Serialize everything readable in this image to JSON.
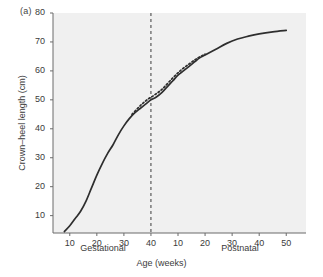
{
  "panel": {
    "label": "(a)"
  },
  "axes": {
    "y_title": "Crown–heel length (cm)",
    "x_title": "Age (weeks)",
    "segment_gestational": "Gestational",
    "segment_postnatal": "Postnatal"
  },
  "annotations": {
    "birth": "Birth"
  },
  "chart_data": {
    "type": "line",
    "title": "",
    "subtitle": "",
    "panel_label": "(a)",
    "xlabel": "Age (weeks)",
    "ylabel": "Crown–heel length (cm)",
    "ylim": [
      4,
      80
    ],
    "yticks": [
      10,
      20,
      30,
      40,
      50,
      60,
      70,
      80
    ],
    "ytick_labels": [
      "10",
      "20",
      "30",
      "40",
      "50",
      "60",
      "70",
      "80"
    ],
    "grid": false,
    "legend": "none",
    "background_color": "#f0f0f0",
    "line_color": "#2e2e2e",
    "x_axis": {
      "segments": [
        {
          "name": "Gestational",
          "ticks": [
            10,
            20,
            30,
            40
          ],
          "tick_labels": [
            "10",
            "20",
            "30",
            "40"
          ],
          "range": [
            6,
            40
          ]
        },
        {
          "name": "Postnatal",
          "ticks": [
            10,
            20,
            30,
            40,
            50
          ],
          "tick_labels": [
            "10",
            "20",
            "30",
            "40",
            "50"
          ],
          "range": [
            0,
            50
          ]
        }
      ]
    },
    "annotations": [
      {
        "text": "Birth",
        "type": "vertical-dashed-line",
        "x_segment": "Gestational",
        "x_value": 40,
        "label_position": "left-of-line"
      }
    ],
    "series": [
      {
        "name": "crown-heel length (solid)",
        "style": "solid",
        "color": "#2e2e2e",
        "points": [
          {
            "segment": "Gestational",
            "x": 8,
            "y": 4.5
          },
          {
            "segment": "Gestational",
            "x": 10,
            "y": 6.5
          },
          {
            "segment": "Gestational",
            "x": 12,
            "y": 9.0
          },
          {
            "segment": "Gestational",
            "x": 14,
            "y": 11.5
          },
          {
            "segment": "Gestational",
            "x": 16,
            "y": 15.0
          },
          {
            "segment": "Gestational",
            "x": 18,
            "y": 19.5
          },
          {
            "segment": "Gestational",
            "x": 20,
            "y": 24.0
          },
          {
            "segment": "Gestational",
            "x": 22,
            "y": 28.0
          },
          {
            "segment": "Gestational",
            "x": 24,
            "y": 31.5
          },
          {
            "segment": "Gestational",
            "x": 26,
            "y": 34.5
          },
          {
            "segment": "Gestational",
            "x": 28,
            "y": 38.0
          },
          {
            "segment": "Gestational",
            "x": 30,
            "y": 41.0
          },
          {
            "segment": "Gestational",
            "x": 32,
            "y": 43.5
          },
          {
            "segment": "Gestational",
            "x": 34,
            "y": 45.5
          },
          {
            "segment": "Gestational",
            "x": 36,
            "y": 47.0
          },
          {
            "segment": "Gestational",
            "x": 38,
            "y": 48.5
          },
          {
            "segment": "Gestational",
            "x": 40,
            "y": 50.0
          },
          {
            "segment": "Postnatal",
            "x": 2,
            "y": 51.0
          },
          {
            "segment": "Postnatal",
            "x": 4,
            "y": 52.5
          },
          {
            "segment": "Postnatal",
            "x": 6,
            "y": 54.5
          },
          {
            "segment": "Postnatal",
            "x": 8,
            "y": 56.5
          },
          {
            "segment": "Postnatal",
            "x": 10,
            "y": 58.5
          },
          {
            "segment": "Postnatal",
            "x": 12,
            "y": 60.0
          },
          {
            "segment": "Postnatal",
            "x": 14,
            "y": 61.5
          },
          {
            "segment": "Postnatal",
            "x": 16,
            "y": 63.0
          },
          {
            "segment": "Postnatal",
            "x": 18,
            "y": 64.5
          },
          {
            "segment": "Postnatal",
            "x": 20,
            "y": 65.5
          },
          {
            "segment": "Postnatal",
            "x": 24,
            "y": 67.5
          },
          {
            "segment": "Postnatal",
            "x": 28,
            "y": 69.5
          },
          {
            "segment": "Postnatal",
            "x": 32,
            "y": 71.0
          },
          {
            "segment": "Postnatal",
            "x": 36,
            "y": 72.0
          },
          {
            "segment": "Postnatal",
            "x": 40,
            "y": 72.8
          },
          {
            "segment": "Postnatal",
            "x": 45,
            "y": 73.5
          },
          {
            "segment": "Postnatal",
            "x": 50,
            "y": 74.0
          }
        ]
      },
      {
        "name": "crown-heel length (dotted, preterm)",
        "style": "dotted",
        "color": "#2e2e2e",
        "points": [
          {
            "segment": "Gestational",
            "x": 33,
            "y": 45.0
          },
          {
            "segment": "Gestational",
            "x": 35,
            "y": 47.0
          },
          {
            "segment": "Gestational",
            "x": 37,
            "y": 48.8
          },
          {
            "segment": "Gestational",
            "x": 39,
            "y": 50.3
          },
          {
            "segment": "Postnatal",
            "x": 1,
            "y": 51.5
          },
          {
            "segment": "Postnatal",
            "x": 3,
            "y": 52.8
          },
          {
            "segment": "Postnatal",
            "x": 5,
            "y": 54.5
          },
          {
            "segment": "Postnatal",
            "x": 8,
            "y": 57.5
          },
          {
            "segment": "Postnatal",
            "x": 11,
            "y": 60.2
          },
          {
            "segment": "Postnatal",
            "x": 14,
            "y": 62.3
          },
          {
            "segment": "Postnatal",
            "x": 17,
            "y": 64.3
          },
          {
            "segment": "Postnatal",
            "x": 20,
            "y": 65.8
          }
        ]
      }
    ]
  }
}
